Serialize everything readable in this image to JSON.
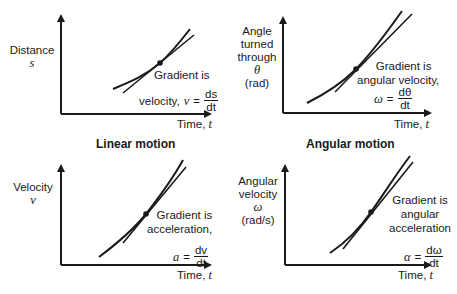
{
  "panels": [
    {
      "id": "distance-time",
      "group": "linear",
      "y_label": [
        "Distance"
      ],
      "y_symbol": "s",
      "x_label": "Time,",
      "x_symbol": "t",
      "gradient_lines": [
        "Gradient is",
        "velocity,"
      ],
      "formula_lhs": "v",
      "formula_num": "ds",
      "formula_den": "dt"
    },
    {
      "id": "angle-time",
      "group": "angular",
      "y_label": [
        "Angle",
        "turned",
        "through"
      ],
      "y_symbol": "θ",
      "y_unit": "(rad)",
      "x_label": "Time,",
      "x_symbol": "t",
      "gradient_lines": [
        "Gradient is",
        "angular velocity,"
      ],
      "formula_lhs": "ω",
      "formula_num": "dθ",
      "formula_den": "dt"
    },
    {
      "id": "velocity-time",
      "group": "linear",
      "y_label": [
        "Velocity"
      ],
      "y_symbol": "v",
      "x_label": "Time,",
      "x_symbol": "t",
      "gradient_lines": [
        "Gradient is",
        "acceleration,"
      ],
      "formula_lhs": "a",
      "formula_num": "dv",
      "formula_den": "dt"
    },
    {
      "id": "angular-velocity-time",
      "group": "angular",
      "y_label": [
        "Angular",
        "velocity"
      ],
      "y_symbol": "ω",
      "y_unit": "(rad/s)",
      "x_label": "Time,",
      "x_symbol": "t",
      "gradient_lines": [
        "Gradient is",
        "angular",
        "acceleration"
      ],
      "formula_lhs": "α",
      "formula_num": "dω",
      "formula_den": "dt"
    }
  ],
  "section_titles": {
    "linear": "Linear motion",
    "angular": "Angular motion"
  },
  "equals": "="
}
